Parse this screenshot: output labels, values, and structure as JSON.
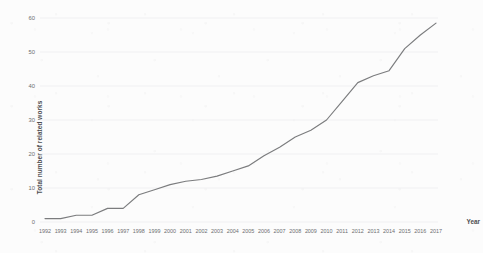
{
  "chart_data": {
    "type": "line",
    "title": "",
    "xlabel": "Year",
    "ylabel": "Total number of related works",
    "categories": [
      "1992",
      "1993",
      "1994",
      "1995",
      "1996",
      "1997",
      "1998",
      "1999",
      "2000",
      "2001",
      "2002",
      "2003",
      "2004",
      "2005",
      "2006",
      "2007",
      "2008",
      "2009",
      "2010",
      "2011",
      "2012",
      "2013",
      "2014",
      "2015",
      "2016",
      "2017"
    ],
    "values": [
      1,
      1,
      2,
      2,
      4,
      4,
      8,
      9.5,
      11,
      12,
      12.5,
      13.5,
      15,
      16.5,
      19.5,
      22,
      25,
      27,
      30,
      35.5,
      41,
      43,
      44.5,
      51,
      55,
      58.5
    ],
    "series": [
      {
        "name": "Total number of related works",
        "values": [
          1,
          1,
          2,
          2,
          4,
          4,
          8,
          9.5,
          11,
          12,
          12.5,
          13.5,
          15,
          16.5,
          19.5,
          22,
          25,
          27,
          30,
          35.5,
          41,
          43,
          44.5,
          51,
          55,
          58.5
        ]
      }
    ],
    "ylim": [
      0,
      60
    ],
    "yticks": [
      0,
      10,
      20,
      30,
      40,
      50,
      60
    ],
    "xlim": [
      "1992",
      "2017"
    ],
    "grid": "horizontal",
    "legend": "none",
    "line_color": "#7b7c7e",
    "grid_color": "#f0f0f2",
    "background": "#fcfcfc"
  },
  "axis": {
    "y_label": "Total number of related works",
    "x_label": "Year",
    "y_tick_labels": [
      "0",
      "10",
      "20",
      "30",
      "40",
      "50",
      "60"
    ],
    "x_tick_labels": [
      "1992",
      "1993",
      "1994",
      "1995",
      "1996",
      "1997",
      "1998",
      "1999",
      "2000",
      "2001",
      "2002",
      "2003",
      "2004",
      "2005",
      "2006",
      "2007",
      "2008",
      "2009",
      "2010",
      "2011",
      "2012",
      "2013",
      "2014",
      "2015",
      "2016",
      "2017"
    ]
  }
}
